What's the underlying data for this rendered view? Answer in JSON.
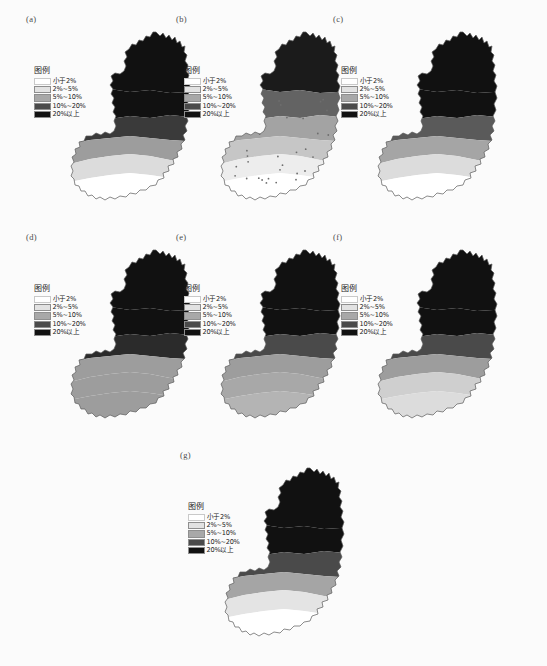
{
  "figure": {
    "background_color": "#fbfbfb",
    "panel_count": 7,
    "legend_title": "图例",
    "legend_classes": [
      {
        "label": "小于2%",
        "color": "#ffffff"
      },
      {
        "label": "2%~5%",
        "color": "#e2e2e2"
      },
      {
        "label": "5%~10%",
        "color": "#a8a8a8"
      },
      {
        "label": "10%~20%",
        "color": "#4a4a4a"
      },
      {
        "label": "20%以上",
        "color": "#111111"
      }
    ]
  },
  "panels": [
    {
      "label": "(a)",
      "legend_title": "图例",
      "classes": [
        {
          "label": "小于2%",
          "color": "#ffffff"
        },
        {
          "label": "2%~5%",
          "color": "#e2e2e2"
        },
        {
          "label": "5%~10%",
          "color": "#a8a8a8"
        },
        {
          "label": "10%~20%",
          "color": "#4a4a4a"
        },
        {
          "label": "20%以上",
          "color": "#111111"
        }
      ],
      "band_fills": [
        "#ffffff",
        "#dcdcdc",
        "#9d9d9d",
        "#3a3a3a",
        "#111111",
        "#111111"
      ]
    },
    {
      "label": "(b)",
      "legend_title": "图例",
      "classes": [
        {
          "label": "小于2%",
          "color": "#ffffff"
        },
        {
          "label": "2%~5%",
          "color": "#e2e2e2"
        },
        {
          "label": "5%~10%",
          "color": "#a8a8a8"
        },
        {
          "label": "10%~20%",
          "color": "#4a4a4a"
        },
        {
          "label": "20%以上",
          "color": "#111111"
        }
      ],
      "band_fills": [
        "#ffffff",
        "#ededed",
        "#c6c6c6",
        "#a3a3a3",
        "#636363",
        "#1b1b1b"
      ]
    },
    {
      "label": "(c)",
      "legend_title": "图例",
      "classes": [
        {
          "label": "小于2%",
          "color": "#ffffff"
        },
        {
          "label": "2%~5%",
          "color": "#e2e2e2"
        },
        {
          "label": "5%~10%",
          "color": "#a8a8a8"
        },
        {
          "label": "10%~20%",
          "color": "#4a4a4a"
        },
        {
          "label": "20%以上",
          "color": "#111111"
        }
      ],
      "band_fills": [
        "#ffffff",
        "#dcdcdc",
        "#a5a5a5",
        "#5a5a5a",
        "#111111",
        "#111111"
      ]
    },
    {
      "label": "(d)",
      "legend_title": "图例",
      "classes": [
        {
          "label": "小于2%",
          "color": "#ffffff"
        },
        {
          "label": "2%~5%",
          "color": "#e2e2e2"
        },
        {
          "label": "5%~10%",
          "color": "#a8a8a8"
        },
        {
          "label": "10%~20%",
          "color": "#4a4a4a"
        },
        {
          "label": "20%以上",
          "color": "#111111"
        }
      ],
      "band_fills": [
        "#9d9d9d",
        "#9d9d9d",
        "#9d9d9d",
        "#2b2b2b",
        "#111111",
        "#111111"
      ]
    },
    {
      "label": "(e)",
      "legend_title": "图例",
      "classes": [
        {
          "label": "小于2%",
          "color": "#ffffff"
        },
        {
          "label": "2%~5%",
          "color": "#e2e2e2"
        },
        {
          "label": "5%~10%",
          "color": "#a8a8a8"
        },
        {
          "label": "10%~20%",
          "color": "#4a4a4a"
        },
        {
          "label": "20%以上",
          "color": "#111111"
        }
      ],
      "band_fills": [
        "#b4b4b4",
        "#a8a8a8",
        "#9d9d9d",
        "#4a4a4a",
        "#111111",
        "#111111"
      ]
    },
    {
      "label": "(f)",
      "legend_title": "图例",
      "classes": [
        {
          "label": "小于2%",
          "color": "#ffffff"
        },
        {
          "label": "2%~5%",
          "color": "#e2e2e2"
        },
        {
          "label": "5%~10%",
          "color": "#a8a8a8"
        },
        {
          "label": "10%~20%",
          "color": "#4a4a4a"
        },
        {
          "label": "20%以上",
          "color": "#111111"
        }
      ],
      "band_fills": [
        "#dcdcdc",
        "#cfcfcf",
        "#9d9d9d",
        "#4a4a4a",
        "#111111",
        "#111111"
      ]
    },
    {
      "label": "(g)",
      "legend_title": "图例",
      "classes": [
        {
          "label": "小于2%",
          "color": "#ffffff"
        },
        {
          "label": "2%~5%",
          "color": "#e2e2e2"
        },
        {
          "label": "5%~10%",
          "color": "#a8a8a8"
        },
        {
          "label": "10%~20%",
          "color": "#4a4a4a"
        },
        {
          "label": "20%以上",
          "color": "#111111"
        }
      ],
      "band_fills": [
        "#ffffff",
        "#e4e4e4",
        "#a5a5a5",
        "#4a4a4a",
        "#111111",
        "#111111"
      ]
    }
  ],
  "chart_data": {
    "type": "heatmap",
    "title": "",
    "subtitle": "",
    "xlabel": "",
    "ylabel": "",
    "legend_position": "inside-left",
    "grid": false,
    "panel_labels": [
      "(a)",
      "(b)",
      "(c)",
      "(d)",
      "(e)",
      "(f)",
      "(g)"
    ],
    "categories": [
      "小于2%",
      "2%~5%",
      "5%~10%",
      "10%~20%",
      "20%以上"
    ],
    "class_breaks": [
      0,
      2,
      5,
      10,
      20,
      100
    ],
    "class_colors": [
      "#ffffff",
      "#e2e2e2",
      "#a8a8a8",
      "#4a4a4a",
      "#111111"
    ],
    "units": "%",
    "series": [
      {
        "name": "(a)",
        "values": [
          1,
          2,
          1,
          1,
          2
        ]
      },
      {
        "name": "(b)",
        "values": [
          1,
          2,
          2,
          1,
          1
        ]
      },
      {
        "name": "(c)",
        "values": [
          1,
          2,
          1,
          2,
          1
        ]
      },
      {
        "name": "(d)",
        "values": [
          0,
          0,
          2,
          2,
          3
        ]
      },
      {
        "name": "(e)",
        "values": [
          0,
          1,
          2,
          1,
          3
        ]
      },
      {
        "name": "(f)",
        "values": [
          1,
          1,
          2,
          1,
          2
        ]
      },
      {
        "name": "(g)",
        "values": [
          1,
          2,
          1,
          1,
          2
        ]
      }
    ],
    "annotations": []
  }
}
